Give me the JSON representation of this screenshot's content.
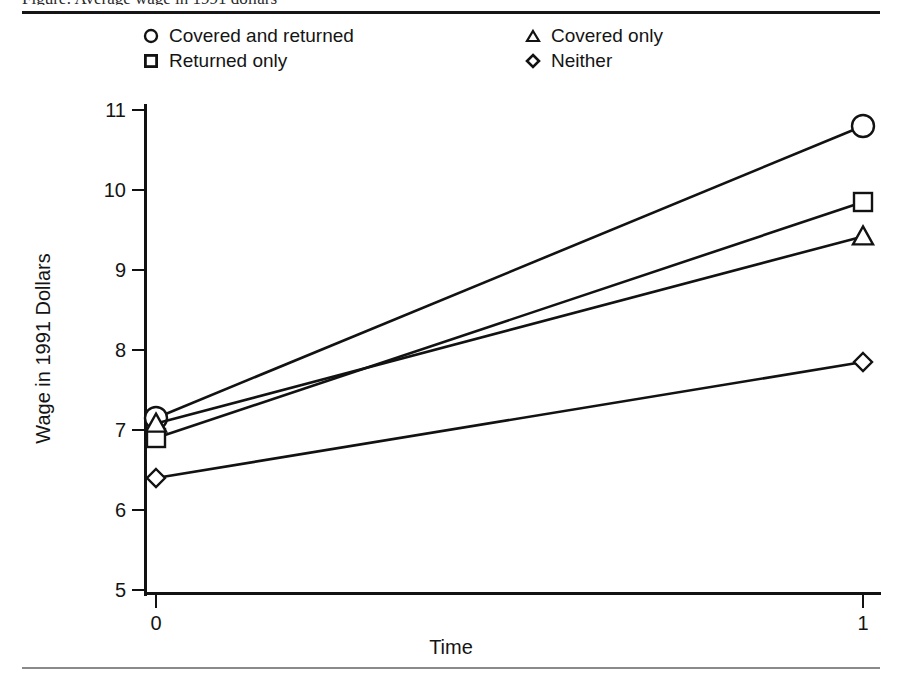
{
  "figure": {
    "title_partial": "Figure: Average wage in 1991 dollars",
    "xlabel": "Time",
    "ylabel": "Wage in 1991 Dollars"
  },
  "legend": {
    "entries": [
      {
        "label": "Covered and returned",
        "marker": "circle-marker-icon",
        "column": 0,
        "row": 0
      },
      {
        "label": "Returned only",
        "marker": "square-marker-icon",
        "column": 0,
        "row": 1
      },
      {
        "label": "Covered only",
        "marker": "triangle-marker-icon",
        "column": 1,
        "row": 0
      },
      {
        "label": "Neither",
        "marker": "diamond-marker-icon",
        "column": 1,
        "row": 1
      }
    ]
  },
  "axes": {
    "y_ticks": [
      "11",
      "10",
      "9",
      "8",
      "7",
      "6",
      "5"
    ],
    "x_ticks": [
      "0",
      "1"
    ]
  },
  "chart_data": {
    "type": "line",
    "title": "Average wage in 1991 dollars",
    "xlabel": "Time",
    "ylabel": "Wage in 1991 Dollars",
    "x": [
      0,
      1
    ],
    "xlim": [
      0,
      1
    ],
    "ylim": [
      5,
      11
    ],
    "xticks": [
      0,
      1
    ],
    "yticks": [
      5,
      6,
      7,
      8,
      9,
      10,
      11
    ],
    "grid": false,
    "legend_position": "top",
    "series": [
      {
        "name": "Covered and returned",
        "marker": "circle",
        "values": [
          7.15,
          10.8
        ]
      },
      {
        "name": "Returned only",
        "marker": "square",
        "values": [
          6.9,
          9.85
        ]
      },
      {
        "name": "Covered only",
        "marker": "triangle",
        "values": [
          7.08,
          9.42
        ]
      },
      {
        "name": "Neither",
        "marker": "diamond",
        "values": [
          6.4,
          7.85
        ]
      }
    ]
  },
  "colors": {
    "ink": "#121212",
    "background": "#ffffff",
    "rule": "#151515"
  }
}
